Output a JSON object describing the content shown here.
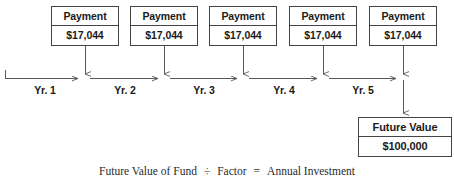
{
  "diagram": {
    "payments": [
      {
        "header": "Payment",
        "amount": "$17,044",
        "year_label": "Yr. 1"
      },
      {
        "header": "Payment",
        "amount": "$17,044",
        "year_label": "Yr. 2"
      },
      {
        "header": "Payment",
        "amount": "$17,044",
        "year_label": "Yr. 3"
      },
      {
        "header": "Payment",
        "amount": "$17,044",
        "year_label": "Yr. 4"
      },
      {
        "header": "Payment",
        "amount": "$17,044",
        "year_label": "Yr. 5"
      }
    ],
    "future_value": {
      "header": "Future Value",
      "amount": "$100,000"
    },
    "formula": {
      "term1": "Future Value of Fund",
      "op1": "÷",
      "term2": "Factor",
      "op2": "=",
      "term3": "Annual Investment"
    },
    "colors": {
      "background": "#ffffff",
      "box_border": "#444444",
      "line": "#595959",
      "text": "#1a1a1a",
      "formula_text": "#2b2b2b"
    }
  }
}
